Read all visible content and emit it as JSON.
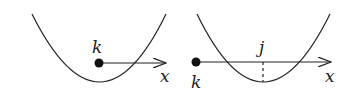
{
  "panels": [
    {
      "name": "left",
      "point_label": "k",
      "axis_label": "x",
      "description": "Point k lies above the parabola's vertex region; arrow points right along x"
    },
    {
      "name": "right",
      "point_label": "k",
      "marker_label": "j",
      "axis_label": "x",
      "description": "Point k on the left; arrow along x crosses the parabola; dashed line marks j at the vertex"
    }
  ],
  "colors": {
    "stroke": "#222222",
    "background": "#ffffff"
  }
}
